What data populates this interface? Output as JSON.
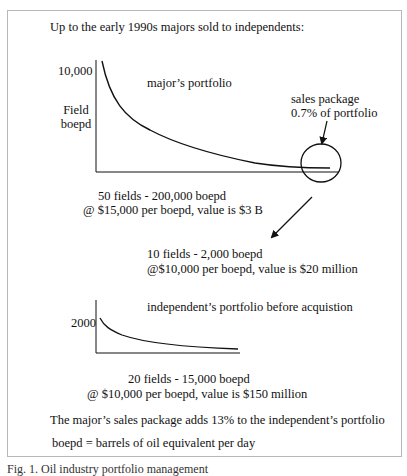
{
  "figure": {
    "title": "Up to the early 1990s majors sold to independents:",
    "major_chart": {
      "y_tick": "10,000",
      "y_label_line1": "Field",
      "y_label_line2": "boepd",
      "curve_label": "major’s portfolio",
      "highlight_label_line1": "sales package",
      "highlight_label_line2": "0.7% of portfolio",
      "summary_line1": "50 fields - 200,000 boepd",
      "summary_line2": "@ $15,000 per boepd, value is $3 B"
    },
    "sales_package": {
      "line1": "10 fields - 2,000 boepd",
      "line2": "@$10,000 per boepd, value is $20 million"
    },
    "independent_chart": {
      "y_tick": "2000",
      "curve_label": "independent’s portfolio before acquistion",
      "summary_line1": "20 fields - 15,000 boepd",
      "summary_line2": "@ $10,000 per boepd, value is $150 million"
    },
    "conclusion": "The major’s sales package adds 13% to the independent’s portfolio",
    "definition": "boepd = barrels of oil equivalent per day"
  },
  "caption": "Fig. 1. Oil industry portfolio management",
  "colors": {
    "line": "#111111",
    "frame": "#b8b8b8"
  }
}
